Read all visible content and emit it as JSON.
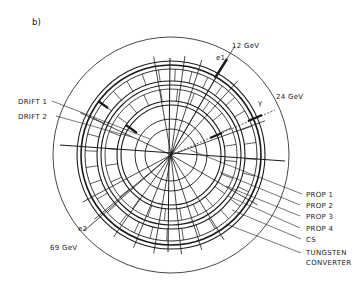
{
  "panel_label": "b)",
  "energies": {
    "e_12": "12 GeV",
    "e_24": "24 GeV",
    "e_69": "69 GeV"
  },
  "tracks": {
    "e1": "e1",
    "e2": "e2",
    "gamma": "γ"
  },
  "left_labels": [
    "DRIFT 1",
    "DRIFT 2"
  ],
  "right_labels": [
    "PROP 1",
    "PROP 2",
    "PROP 3",
    "PROP 4",
    "CS",
    "TUNGSTEN",
    "CONVERTER"
  ],
  "colors": {
    "ink": "#1a1a1a",
    "background": "#ffffff"
  }
}
